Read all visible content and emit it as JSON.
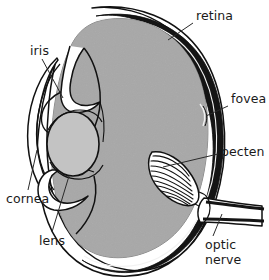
{
  "figure": {
    "width": 269,
    "height": 280,
    "background_color": "#ffffff",
    "line_color": "#111111",
    "style": "black-and-white line drawing with gray shading"
  },
  "colors": {
    "background": "#ffffff",
    "vitreous_fill": "#a8a8a8",
    "lens_fill": "#c3c3c3",
    "retina_band": "#141414",
    "outline": "#111111",
    "label_text": "#1a1a1a",
    "leader_line": "#2a2a2a"
  },
  "labels": [
    {
      "id": "retina",
      "text": "retina",
      "x": 196,
      "y": 9,
      "lines": [
        "retina"
      ],
      "leader_from": [
        193,
        23
      ],
      "leader_to": [
        168,
        40
      ]
    },
    {
      "id": "fovea",
      "text": "fovea",
      "x": 231,
      "y": 92,
      "lines": [
        "fovea"
      ],
      "leader_from": [
        228,
        106
      ],
      "leader_to": [
        206,
        116
      ]
    },
    {
      "id": "pecten",
      "text": "pecten",
      "x": 221,
      "y": 145,
      "lines": [
        "pecten"
      ],
      "leader_from": [
        218,
        154
      ],
      "leader_to": [
        163,
        167
      ]
    },
    {
      "id": "optic-nerve",
      "text": "optic nerve",
      "x": 205,
      "y": 238,
      "lines": [
        "optic",
        "nerve"
      ],
      "leader_from": [
        213,
        236
      ],
      "leader_to": [
        222,
        214
      ]
    },
    {
      "id": "iris",
      "text": "iris",
      "x": 30,
      "y": 44,
      "lines": [
        "iris"
      ],
      "leader_from": [
        42,
        59
      ],
      "leader_to": [
        63,
        98
      ]
    },
    {
      "id": "cornea",
      "text": "cornea",
      "x": 6,
      "y": 192,
      "lines": [
        "cornea"
      ],
      "leader_from": [
        28,
        190
      ],
      "leader_to": [
        37,
        150
      ]
    },
    {
      "id": "lens",
      "text": "lens",
      "x": 39,
      "y": 234,
      "lines": [
        "lens"
      ],
      "leader_from": [
        52,
        232
      ],
      "leader_to": [
        69,
        176
      ]
    }
  ],
  "structures": [
    {
      "id": "sclera",
      "name": "sclera outer wall",
      "described": "outer thin outline of the eyeball"
    },
    {
      "id": "retina",
      "name": "retina",
      "described": "thick dark band lining the inner posterior wall"
    },
    {
      "id": "vitreous",
      "name": "vitreous chamber",
      "described": "large gray-filled interior cavity"
    },
    {
      "id": "lens",
      "name": "lens",
      "described": "light gray oval at the front of the eye"
    },
    {
      "id": "iris",
      "name": "iris",
      "described": "hooked folds above and below the lens"
    },
    {
      "id": "cornea",
      "name": "cornea",
      "described": "curved transparent front surface"
    },
    {
      "id": "fovea",
      "name": "fovea",
      "described": "shallow pit in the retina on the posterior wall"
    },
    {
      "id": "pecten",
      "name": "pecten",
      "described": "pleated, striated vascular fan projecting into the vitreous"
    },
    {
      "id": "optic-nerve",
      "name": "optic nerve",
      "described": "tubular nerve exiting the posterior pole to the right"
    }
  ],
  "pecten": {
    "pleat_count": 9,
    "orientation": "upper-left to lower-right"
  }
}
